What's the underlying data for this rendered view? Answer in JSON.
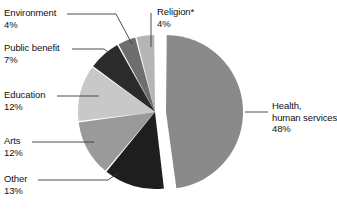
{
  "chart_data": {
    "type": "pie",
    "title": "",
    "subtitle": "",
    "xlabel": "",
    "ylabel": "",
    "legend_position": "callout-labels",
    "grid": false,
    "units": "percent",
    "exploded_slice": "Health, human services",
    "footnote_marker": "*",
    "categories": [
      "Health, human services",
      "Religion*",
      "Environment",
      "Public benefit",
      "Education",
      "Arts",
      "Other"
    ],
    "values": [
      48,
      4,
      4,
      7,
      12,
      12,
      13
    ],
    "colors": [
      "#8a8a8a",
      "#b5b5b5",
      "#6e6e6e",
      "#2b2b2b",
      "#c8c8c8",
      "#9a9a9a",
      "#1e1e1e"
    ],
    "slices": [
      {
        "label": "Health,",
        "label_line2": "human services",
        "value": 48,
        "value_text": "48%",
        "color": "#8a8a8a",
        "exploded": true
      },
      {
        "label": "Religion*",
        "value": 4,
        "value_text": "4%",
        "color": "#b5b5b5",
        "exploded": false
      },
      {
        "label": "Environment",
        "value": 4,
        "value_text": "4%",
        "color": "#6e6e6e",
        "exploded": false
      },
      {
        "label": "Public benefit",
        "value": 7,
        "value_text": "7%",
        "color": "#2b2b2b",
        "exploded": false
      },
      {
        "label": "Education",
        "value": 12,
        "value_text": "12%",
        "color": "#c8c8c8",
        "exploded": false
      },
      {
        "label": "Arts",
        "value": 12,
        "value_text": "12%",
        "color": "#9a9a9a",
        "exploded": false
      },
      {
        "label": "Other",
        "value": 13,
        "value_text": "13%",
        "color": "#1e1e1e",
        "exploded": false
      }
    ]
  },
  "labels": {
    "environment": {
      "name": "Environment",
      "pct": "4%"
    },
    "public_benefit": {
      "name": "Public benefit",
      "pct": "7%"
    },
    "education": {
      "name": "Education",
      "pct": "12%"
    },
    "arts": {
      "name": "Arts",
      "pct": "12%"
    },
    "other": {
      "name": "Other",
      "pct": "13%"
    },
    "religion": {
      "name": "Religion*",
      "pct": "4%"
    },
    "health_line1": "Health,",
    "health_line2": "human services",
    "health_pct": "48%"
  },
  "style": {
    "background": "#ffffff",
    "text_color": "#111111",
    "leader_line_color": "#3a3a3a"
  }
}
